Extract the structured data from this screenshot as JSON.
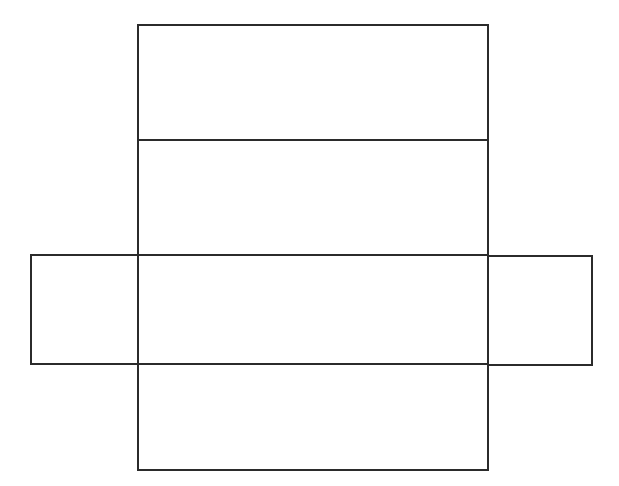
{
  "diagram": {
    "type": "rectangular-prism-net",
    "faces": [
      {
        "id": "top-face",
        "role": "top"
      },
      {
        "id": "back-face",
        "role": "back"
      },
      {
        "id": "left-face",
        "role": "left side"
      },
      {
        "id": "base-face",
        "role": "base"
      },
      {
        "id": "right-face",
        "role": "right side"
      },
      {
        "id": "front-face",
        "role": "front"
      }
    ],
    "labels": []
  }
}
